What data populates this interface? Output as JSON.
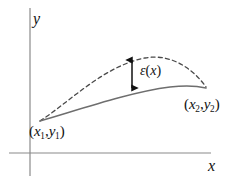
{
  "figure": {
    "background_color": "#ffffff",
    "width": 244,
    "height": 188
  },
  "axes": {
    "x_axis_label": "x",
    "y_axis_label": "y",
    "axis_color": "#8a8a8a",
    "x_axis": {
      "x1": 9,
      "y1": 153,
      "x2": 211,
      "y2": 153
    },
    "y_axis": {
      "x1": 30,
      "y1": 8,
      "x2": 30,
      "y2": 176
    }
  },
  "labels": {
    "point1": {
      "open": "(",
      "x_var": "x",
      "x_sub": "1",
      "comma": ",",
      "y_var": "y",
      "y_sub": "1",
      "close": ")"
    },
    "point2": {
      "open": "(",
      "x_var": "x",
      "x_sub": "2",
      "comma": ",",
      "y_var": "y",
      "y_sub": "2",
      "close": ")"
    },
    "epsilon": {
      "symbol": "ε",
      "open": "(",
      "arg": "x",
      "close": ")"
    }
  },
  "curves": [
    {
      "name": "exact-curve-dashed",
      "style": "dashed",
      "color": "#4a4a4a",
      "stroke_width": 1.3,
      "dash_pattern": "4 3.2",
      "path": "M 40 121 C 72 100, 104 66, 145 58 C 172 53, 194 70, 206 87",
      "description": "Upper dashed arc from (x1,y1) rising to a peak then descending to (x2,y2)"
    },
    {
      "name": "approximation-curve-solid",
      "style": "solid",
      "color": "#6e6e6e",
      "stroke_width": 1.5,
      "path": "M 40 121 C 78 110, 130 92, 170 87 C 186 85, 198 86, 206 88",
      "description": "Lower solid curve from (x1,y1) to (x2,y2)"
    }
  ],
  "annotation": {
    "name": "epsilon-measure-arrow",
    "type": "double-headed-vertical-arrow",
    "color": "#111111",
    "x": 132,
    "y_top": 59,
    "y_bottom": 89,
    "description": "Double-headed arrow measuring vertical gap epsilon(x) between dashed and solid curves"
  },
  "endpoints": {
    "start": {
      "x": 40,
      "y": 121,
      "label": "point1"
    },
    "end": {
      "x": 206,
      "y": 87,
      "label": "point2"
    }
  }
}
